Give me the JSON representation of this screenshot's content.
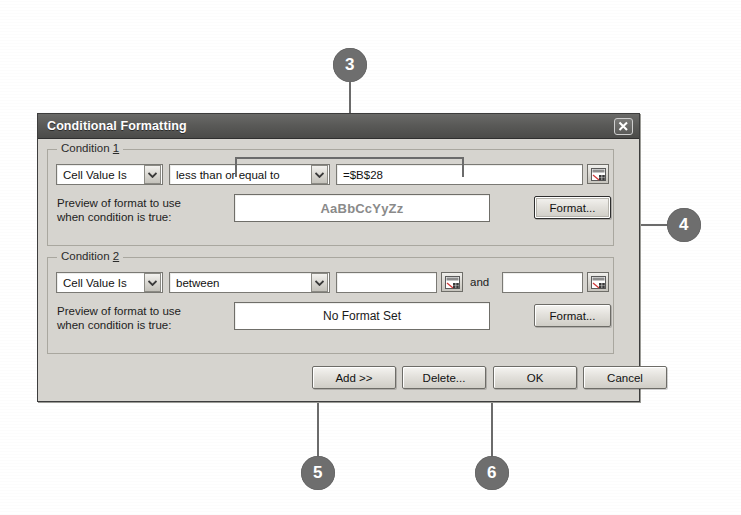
{
  "dialog": {
    "title": "Conditional Formatting",
    "close_icon": "close-icon",
    "condition1": {
      "legend_text": "Condition ",
      "legend_number": "1",
      "operator_type": "Cell Value Is",
      "comparison": "less than or equal to",
      "value1": "=$B$28",
      "range_button_icon": "range-selector-icon",
      "preview_label": "Preview of format to use\nwhen condition is true:",
      "preview_text": "AaBbCcYyZz",
      "preview_color": "#8a8a8a",
      "format_button": "Format...",
      "format_button_accesskey": "F"
    },
    "condition2": {
      "legend_text": "Condition ",
      "legend_number": "2",
      "operator_type": "Cell Value Is",
      "comparison": "between",
      "value1": "",
      "value2": "",
      "between_word": "and",
      "range_button_icon": "range-selector-icon",
      "preview_label": "Preview of format to use\nwhen condition is true:",
      "preview_text": "No Format Set",
      "format_button": "Format...",
      "format_button_accesskey": "o"
    },
    "buttons": {
      "add": "Add >>",
      "add_accesskey": "A",
      "delete": "Delete...",
      "delete_accesskey": "D",
      "ok": "OK",
      "cancel": "Cancel"
    }
  },
  "callouts": [
    {
      "number": "3",
      "target": "formula-input-condition1"
    },
    {
      "number": "4",
      "target": "format-button-condition1"
    },
    {
      "number": "5",
      "target": "add-button"
    },
    {
      "number": "6",
      "target": "ok-button"
    }
  ]
}
